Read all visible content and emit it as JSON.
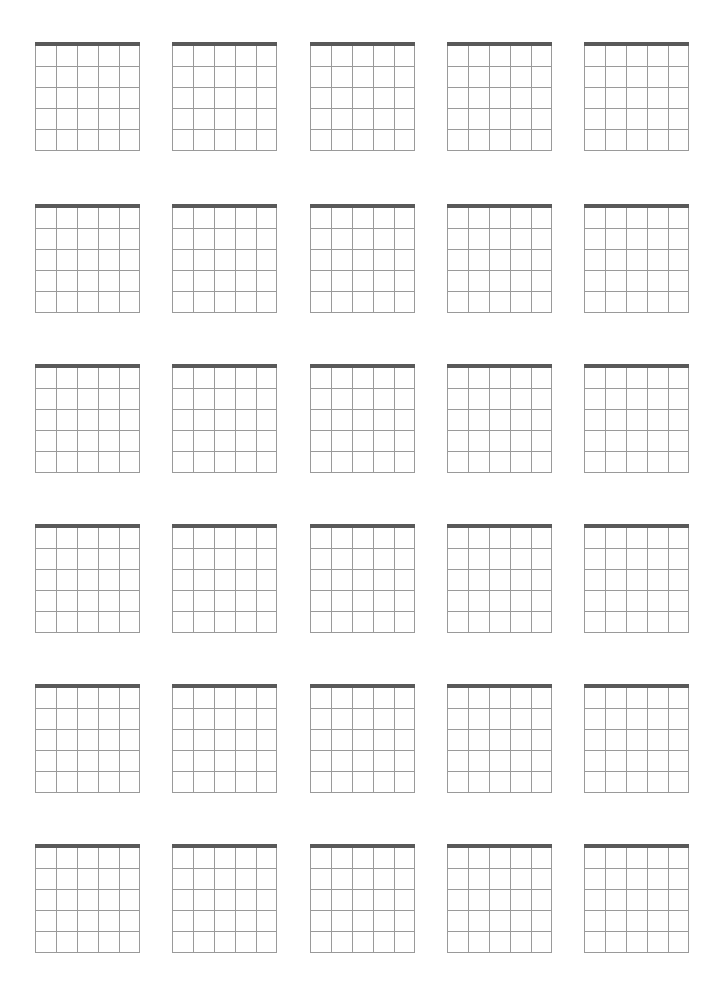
{
  "document": {
    "kind": "blank-guitar-chord-chart-sheet",
    "page_width": 704,
    "page_height": 1002,
    "background_color": "#ffffff",
    "has_text": false,
    "title_text": "",
    "notes_text": ""
  },
  "sheet": {
    "rows": 6,
    "columns": 5,
    "total_diagrams": 30,
    "column_x_positions": [
      35,
      172,
      310,
      447,
      584
    ],
    "row_y_positions": [
      41,
      203,
      363,
      523,
      683,
      843
    ]
  },
  "diagram": {
    "label": "",
    "width": 105,
    "height": 105,
    "strings": 6,
    "frets": 5,
    "string_spacing": 21,
    "fret_spacing": 21,
    "nut": {
      "visible": true,
      "thickness": 4,
      "color": "#595959"
    },
    "grid": {
      "line_color": "#9a9a9a",
      "line_width": 1
    },
    "markers": [],
    "open_string_indicators": [],
    "muted_string_indicators": [],
    "fret_position_label": "",
    "finger_numbers": []
  },
  "chart_data": {
    "type": "table",
    "title": "",
    "xlabel": "",
    "ylabel": "",
    "categories": [
      "string-1",
      "string-2",
      "string-3",
      "string-4",
      "string-5",
      "string-6"
    ],
    "values": [
      0,
      0,
      0,
      0,
      0,
      0
    ],
    "grid": true,
    "legend": "none",
    "diagram_cells": [
      {
        "row": 1,
        "col": 1,
        "label": "",
        "markers": []
      },
      {
        "row": 1,
        "col": 2,
        "label": "",
        "markers": []
      },
      {
        "row": 1,
        "col": 3,
        "label": "",
        "markers": []
      },
      {
        "row": 1,
        "col": 4,
        "label": "",
        "markers": []
      },
      {
        "row": 1,
        "col": 5,
        "label": "",
        "markers": []
      },
      {
        "row": 2,
        "col": 1,
        "label": "",
        "markers": []
      },
      {
        "row": 2,
        "col": 2,
        "label": "",
        "markers": []
      },
      {
        "row": 2,
        "col": 3,
        "label": "",
        "markers": []
      },
      {
        "row": 2,
        "col": 4,
        "label": "",
        "markers": []
      },
      {
        "row": 2,
        "col": 5,
        "label": "",
        "markers": []
      },
      {
        "row": 3,
        "col": 1,
        "label": "",
        "markers": []
      },
      {
        "row": 3,
        "col": 2,
        "label": "",
        "markers": []
      },
      {
        "row": 3,
        "col": 3,
        "label": "",
        "markers": []
      },
      {
        "row": 3,
        "col": 4,
        "label": "",
        "markers": []
      },
      {
        "row": 3,
        "col": 5,
        "label": "",
        "markers": []
      },
      {
        "row": 4,
        "col": 1,
        "label": "",
        "markers": []
      },
      {
        "row": 4,
        "col": 2,
        "label": "",
        "markers": []
      },
      {
        "row": 4,
        "col": 3,
        "label": "",
        "markers": []
      },
      {
        "row": 4,
        "col": 4,
        "label": "",
        "markers": []
      },
      {
        "row": 4,
        "col": 5,
        "label": "",
        "markers": []
      },
      {
        "row": 5,
        "col": 1,
        "label": "",
        "markers": []
      },
      {
        "row": 5,
        "col": 2,
        "label": "",
        "markers": []
      },
      {
        "row": 5,
        "col": 3,
        "label": "",
        "markers": []
      },
      {
        "row": 5,
        "col": 4,
        "label": "",
        "markers": []
      },
      {
        "row": 5,
        "col": 5,
        "label": "",
        "markers": []
      },
      {
        "row": 6,
        "col": 1,
        "label": "",
        "markers": []
      },
      {
        "row": 6,
        "col": 2,
        "label": "",
        "markers": []
      },
      {
        "row": 6,
        "col": 3,
        "label": "",
        "markers": []
      },
      {
        "row": 6,
        "col": 4,
        "label": "",
        "markers": []
      },
      {
        "row": 6,
        "col": 5,
        "label": "",
        "markers": []
      }
    ]
  }
}
